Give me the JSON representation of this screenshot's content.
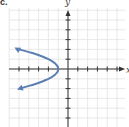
{
  "panel": {
    "label": "c."
  },
  "axes": {
    "x_label": "x",
    "y_label": "y"
  },
  "colors": {
    "curve": "#5b7fb2",
    "grid": "#e2e2e2",
    "axis": "#333333",
    "background": "#ffffff"
  },
  "chart_data": {
    "type": "line",
    "title": "",
    "xlabel": "x",
    "ylabel": "y",
    "equation": "x = -y^2 - 1",
    "vertex": [
      -1,
      0
    ],
    "points": [
      {
        "x": -5.8,
        "y": 2.2
      },
      {
        "x": -5,
        "y": 2
      },
      {
        "x": -3.25,
        "y": 1.5
      },
      {
        "x": -2,
        "y": 1
      },
      {
        "x": -1.25,
        "y": 0.5
      },
      {
        "x": -1,
        "y": 0
      },
      {
        "x": -1.25,
        "y": -0.5
      },
      {
        "x": -2,
        "y": -1
      },
      {
        "x": -3.25,
        "y": -1.5
      },
      {
        "x": -5,
        "y": -2
      },
      {
        "x": -5.4,
        "y": -2.1
      }
    ],
    "xlim": [
      -6,
      6
    ],
    "ylim": [
      -6,
      6
    ],
    "grid": true,
    "tick_spacing": 1,
    "arrows": "both ends of curve and positive axis directions",
    "legend": null
  }
}
